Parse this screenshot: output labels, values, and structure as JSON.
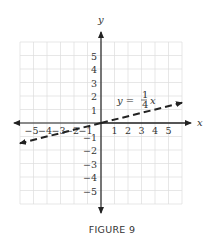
{
  "caption": "FIGURE 9",
  "chart_data": {
    "type": "line",
    "title": "",
    "xlabel": "x",
    "ylabel": "y",
    "xlim": [
      -6,
      6
    ],
    "ylim": [
      -6,
      6
    ],
    "grid": true,
    "x_ticks": [
      "−5",
      "−4",
      "−3",
      "−2",
      "−1",
      "1",
      "2",
      "3",
      "4",
      "5"
    ],
    "y_ticks": [
      "5",
      "4",
      "3",
      "2",
      "1",
      "−1",
      "−2",
      "−3",
      "−4",
      "−5"
    ],
    "series": [
      {
        "name": "y = 1/4 x",
        "equation": "y = (1/4)x",
        "style": "dashed",
        "arrows": "both",
        "x": [
          -6,
          -4,
          0,
          4,
          6
        ],
        "y": [
          -1.5,
          -1,
          0,
          1,
          1.5
        ]
      }
    ],
    "annotations": [
      {
        "text": "y = 1/4 x",
        "x": 3.2,
        "y": 2
      }
    ]
  }
}
